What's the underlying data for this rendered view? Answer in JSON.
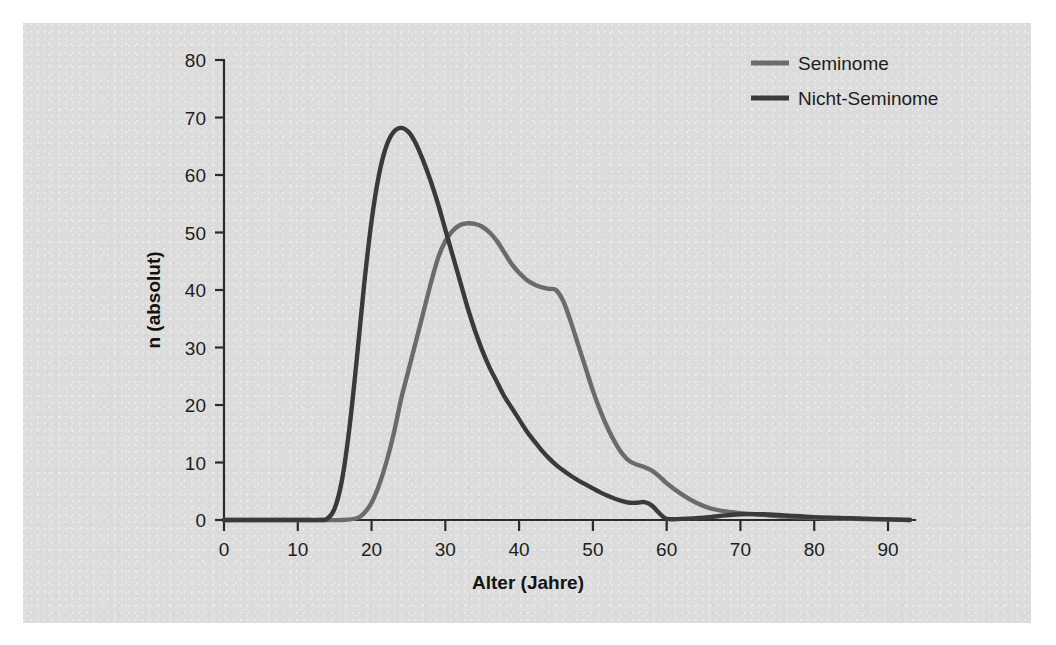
{
  "figure": {
    "panel_background": "#dcdcdc",
    "page_background": "#ffffff"
  },
  "chart_data": {
    "type": "line",
    "title": "",
    "subtitle": "",
    "xlabel": "Alter (Jahre)",
    "ylabel": "n (absolut)",
    "xlim": [
      0,
      93
    ],
    "ylim": [
      0,
      80
    ],
    "xticks": [
      0,
      10,
      20,
      30,
      40,
      50,
      60,
      70,
      80,
      90
    ],
    "xtick_labels": [
      "0",
      "10",
      "20",
      "30",
      "40",
      "50",
      "60",
      "70",
      "80",
      "90"
    ],
    "yticks": [
      0,
      10,
      20,
      30,
      40,
      50,
      60,
      70,
      80
    ],
    "ytick_labels": [
      "0",
      "10",
      "20",
      "30",
      "40",
      "50",
      "60",
      "70",
      "80"
    ],
    "grid": false,
    "legend_position": "top-right",
    "annotations": [],
    "series": [
      {
        "name": "Seminome",
        "color": "#6b6b6b",
        "x": [
          0,
          5,
          10,
          14,
          16,
          18,
          19,
          20,
          21,
          22,
          23,
          24,
          25,
          26,
          27,
          28,
          29,
          30,
          31,
          32,
          33,
          34,
          35,
          36,
          37,
          38,
          39,
          40,
          41,
          42,
          43,
          44,
          45,
          46,
          47,
          48,
          49,
          50,
          51,
          52,
          53,
          54,
          55,
          56,
          57,
          58,
          59,
          60,
          62,
          64,
          66,
          68,
          70,
          73,
          76,
          80,
          85,
          90,
          93
        ],
        "y": [
          0,
          0,
          0,
          0,
          0,
          0.3,
          1.2,
          3.0,
          6.0,
          10.0,
          15.0,
          21.0,
          26.0,
          31.0,
          36.0,
          41.0,
          45.5,
          48.5,
          50.3,
          51.3,
          51.6,
          51.5,
          51.0,
          50.0,
          48.5,
          46.5,
          44.5,
          43.0,
          41.8,
          41.0,
          40.5,
          40.2,
          40.0,
          38.0,
          34.5,
          30.5,
          26.5,
          22.5,
          19.0,
          16.0,
          13.5,
          11.5,
          10.2,
          9.6,
          9.2,
          8.6,
          7.6,
          6.4,
          4.5,
          3.0,
          2.0,
          1.5,
          1.2,
          0.9,
          0.6,
          0.4,
          0.2,
          0.1,
          0.0
        ]
      },
      {
        "name": "Nicht-Seminome",
        "color": "#3a3a3a",
        "x": [
          0,
          5,
          10,
          13,
          14,
          15,
          16,
          17,
          18,
          19,
          20,
          21,
          22,
          23,
          24,
          25,
          26,
          27,
          28,
          29,
          30,
          31,
          32,
          33,
          34,
          35,
          36,
          37,
          38,
          39,
          40,
          41,
          42,
          43,
          44,
          45,
          46,
          47,
          48,
          49,
          50,
          51,
          52,
          53,
          54,
          55,
          56,
          57,
          58,
          59,
          60,
          62,
          65,
          68,
          70,
          73,
          76,
          80,
          85,
          90,
          93
        ],
        "y": [
          0,
          0,
          0,
          0,
          0.2,
          2.0,
          7.0,
          16.0,
          28.0,
          41.0,
          52.0,
          60.0,
          65.0,
          67.5,
          68.2,
          67.5,
          65.5,
          62.5,
          59.0,
          55.0,
          50.5,
          46.0,
          41.5,
          37.0,
          33.0,
          29.5,
          26.5,
          24.0,
          21.5,
          19.5,
          17.5,
          15.5,
          13.8,
          12.2,
          10.8,
          9.6,
          8.6,
          7.7,
          6.9,
          6.2,
          5.5,
          4.8,
          4.2,
          3.7,
          3.3,
          3.0,
          3.0,
          3.1,
          2.5,
          1.2,
          0.2,
          0.2,
          0.4,
          0.8,
          1.0,
          1.0,
          0.8,
          0.5,
          0.3,
          0.1,
          0.0
        ]
      }
    ]
  },
  "legend": {
    "items": [
      {
        "label": "Seminome",
        "color": "#6b6b6b"
      },
      {
        "label": "Nicht-Seminome",
        "color": "#3a3a3a"
      }
    ]
  }
}
